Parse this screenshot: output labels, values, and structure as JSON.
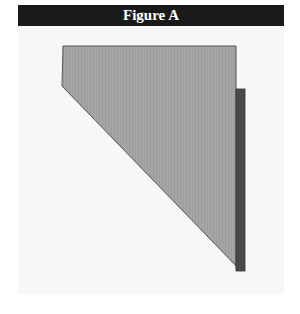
{
  "figure": {
    "title": "Figure A",
    "colors": {
      "header_bg": "#1a1a1a",
      "header_text": "#ffffff",
      "panel_bg": "#f7f7f7",
      "shape_fill": "#a3a3a3",
      "shape_stroke": "#555555",
      "bar_fill": "#4a4a4a"
    },
    "shapes": [
      {
        "name": "gray-polygon",
        "points": "63,46 236,46 236,268 241,271 62,86"
      },
      {
        "name": "dark-bar",
        "x": 236,
        "y": 89,
        "width": 9,
        "height": 182
      }
    ]
  }
}
